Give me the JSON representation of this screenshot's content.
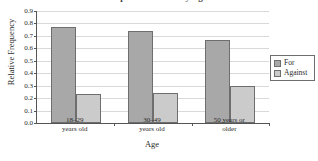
{
  "chart_data": {
    "type": "bar",
    "title": "Opinion on Issue by Age",
    "xlabel": "Age",
    "ylabel": "Relative Frequency",
    "categories": [
      "18–29\nyears old",
      "30–49\nyears old",
      "50 years or\nolder"
    ],
    "category_lines": [
      [
        "18–29",
        "years old"
      ],
      [
        "30–49",
        "years old"
      ],
      [
        "50 years or",
        "older"
      ]
    ],
    "series": [
      {
        "name": "For",
        "values": [
          0.77,
          0.74,
          0.67
        ],
        "color": "#a8a8a8"
      },
      {
        "name": "Against",
        "values": [
          0.23,
          0.24,
          0.3
        ],
        "color": "#cbcbcb"
      }
    ],
    "ylim": [
      0.0,
      0.9
    ],
    "ytick_labels": [
      "0.0",
      "0.1",
      "0.2",
      "0.3",
      "0.4",
      "0.5",
      "0.6",
      "0.7",
      "0.8",
      "0.9"
    ],
    "ytick_values": [
      0.0,
      0.1,
      0.2,
      0.3,
      0.4,
      0.5,
      0.6,
      0.7,
      0.8,
      0.9
    ],
    "grid": true,
    "legend_position": "outside-right"
  },
  "legend": {
    "entries": [
      {
        "label": "For"
      },
      {
        "label": "Against"
      }
    ]
  }
}
